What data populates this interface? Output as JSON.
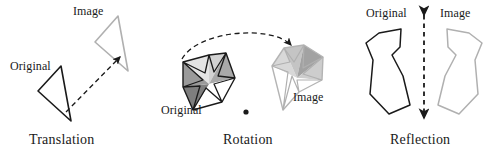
{
  "figure": {
    "width": 496,
    "height": 156,
    "background": "#ffffff"
  },
  "colors": {
    "original_stroke": "#1a1a1a",
    "image_stroke": "#a8a8a8",
    "dash_stroke": "#1a1a1a",
    "text": "#1a1a1a",
    "star_facet_darkest": "#7d7d7d",
    "star_facet_dark": "#9d9d9d",
    "star_facet_mid": "#bdbdbd",
    "star_facet_light": "#d8d8d8",
    "star_facet_lightest": "#efefef",
    "star_face_white": "#ffffff"
  },
  "panels": [
    {
      "id": "translation",
      "caption": "Translation",
      "original_label": "Original",
      "image_label": "Image",
      "shape": "triangle",
      "arrow": "dashed-straight-arrow"
    },
    {
      "id": "rotation",
      "caption": "Rotation",
      "original_label": "Original",
      "image_label": "Image",
      "shape": "five-point-star",
      "arrow": "dashed-curved-arrow",
      "center_of_rotation": "dot"
    },
    {
      "id": "reflection",
      "caption": "Reflection",
      "original_label": "Original",
      "image_label": "Image",
      "shape": "irregular-polygon",
      "mirror_line": "vertical-dashed-double-arrow"
    }
  ]
}
